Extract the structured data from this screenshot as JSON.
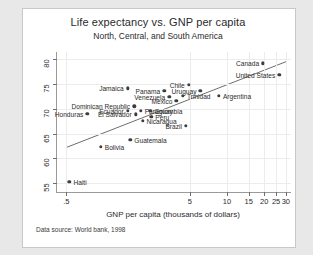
{
  "chart_data": {
    "type": "scatter",
    "title": "Life expectancy vs. GNP per capita",
    "subtitle": "North, Central, and South America",
    "xlabel": "GNP per capita (thousands of dollars)",
    "ylabel": "Life expectancy at birth (years)",
    "note": "Data source:  World bank, 1998",
    "xscale": "log",
    "xlim": [
      0.42,
      33
    ],
    "ylim": [
      53.2,
      81.5
    ],
    "xticks": [
      0.5,
      5,
      10,
      15,
      20,
      25,
      30
    ],
    "xticklabels": [
      ".5",
      "5",
      "10",
      "15",
      "20",
      "25",
      "30"
    ],
    "yticks": [
      55,
      60,
      65,
      70,
      75,
      80
    ],
    "yticklabels": [
      "55",
      "60",
      "65",
      "70",
      "75",
      "80"
    ],
    "grid": true,
    "legend": "none",
    "marker_color": "#3d3d3d",
    "line_color": "#6e6e6e",
    "fit_line": {
      "x0": 0.5,
      "y0": 62.2,
      "x1": 30.5,
      "y1": 79.6
    },
    "points": [
      {
        "name": "Canada",
        "x": 19.6,
        "y": 79.2,
        "side": "left"
      },
      {
        "name": "United States",
        "x": 26.5,
        "y": 76.9,
        "side": "left"
      },
      {
        "name": "Chile",
        "x": 4.9,
        "y": 74.9,
        "side": "left"
      },
      {
        "name": "Uruguay",
        "x": 6.1,
        "y": 73.6,
        "side": "left"
      },
      {
        "name": "Jamaica",
        "x": 1.57,
        "y": 74.2,
        "side": "left"
      },
      {
        "name": "Panama",
        "x": 3.1,
        "y": 73.6,
        "side": "left"
      },
      {
        "name": "Argentina",
        "x": 8.6,
        "y": 72.6,
        "side": "right"
      },
      {
        "name": "Trinidad",
        "x": 4.4,
        "y": 72.7,
        "side": "right"
      },
      {
        "name": "Venezuela",
        "x": 3.4,
        "y": 72.4,
        "side": "left"
      },
      {
        "name": "Mexico",
        "x": 3.9,
        "y": 71.6,
        "side": "left"
      },
      {
        "name": "Dominican Republic",
        "x": 1.77,
        "y": 70.5,
        "side": "left"
      },
      {
        "name": "Ecuador",
        "x": 1.57,
        "y": 69.6,
        "side": "left"
      },
      {
        "name": "Paraguay",
        "x": 2.0,
        "y": 69.6,
        "side": "right"
      },
      {
        "name": "Colombia",
        "x": 2.4,
        "y": 69.6,
        "side": "right"
      },
      {
        "name": "Honduras",
        "x": 0.74,
        "y": 69.0,
        "side": "left"
      },
      {
        "name": "El Salvador",
        "x": 1.82,
        "y": 68.9,
        "side": "left"
      },
      {
        "name": "Peru",
        "x": 2.44,
        "y": 68.4,
        "side": "right"
      },
      {
        "name": "Nicaragua",
        "x": 2.07,
        "y": 67.6,
        "side": "right"
      },
      {
        "name": "Brazil",
        "x": 4.65,
        "y": 66.6,
        "side": "left"
      },
      {
        "name": "Guatemala",
        "x": 1.65,
        "y": 63.8,
        "side": "right"
      },
      {
        "name": "Bolivia",
        "x": 0.95,
        "y": 62.3,
        "side": "right"
      },
      {
        "name": "Haiti",
        "x": 0.53,
        "y": 55.2,
        "side": "right"
      }
    ]
  }
}
